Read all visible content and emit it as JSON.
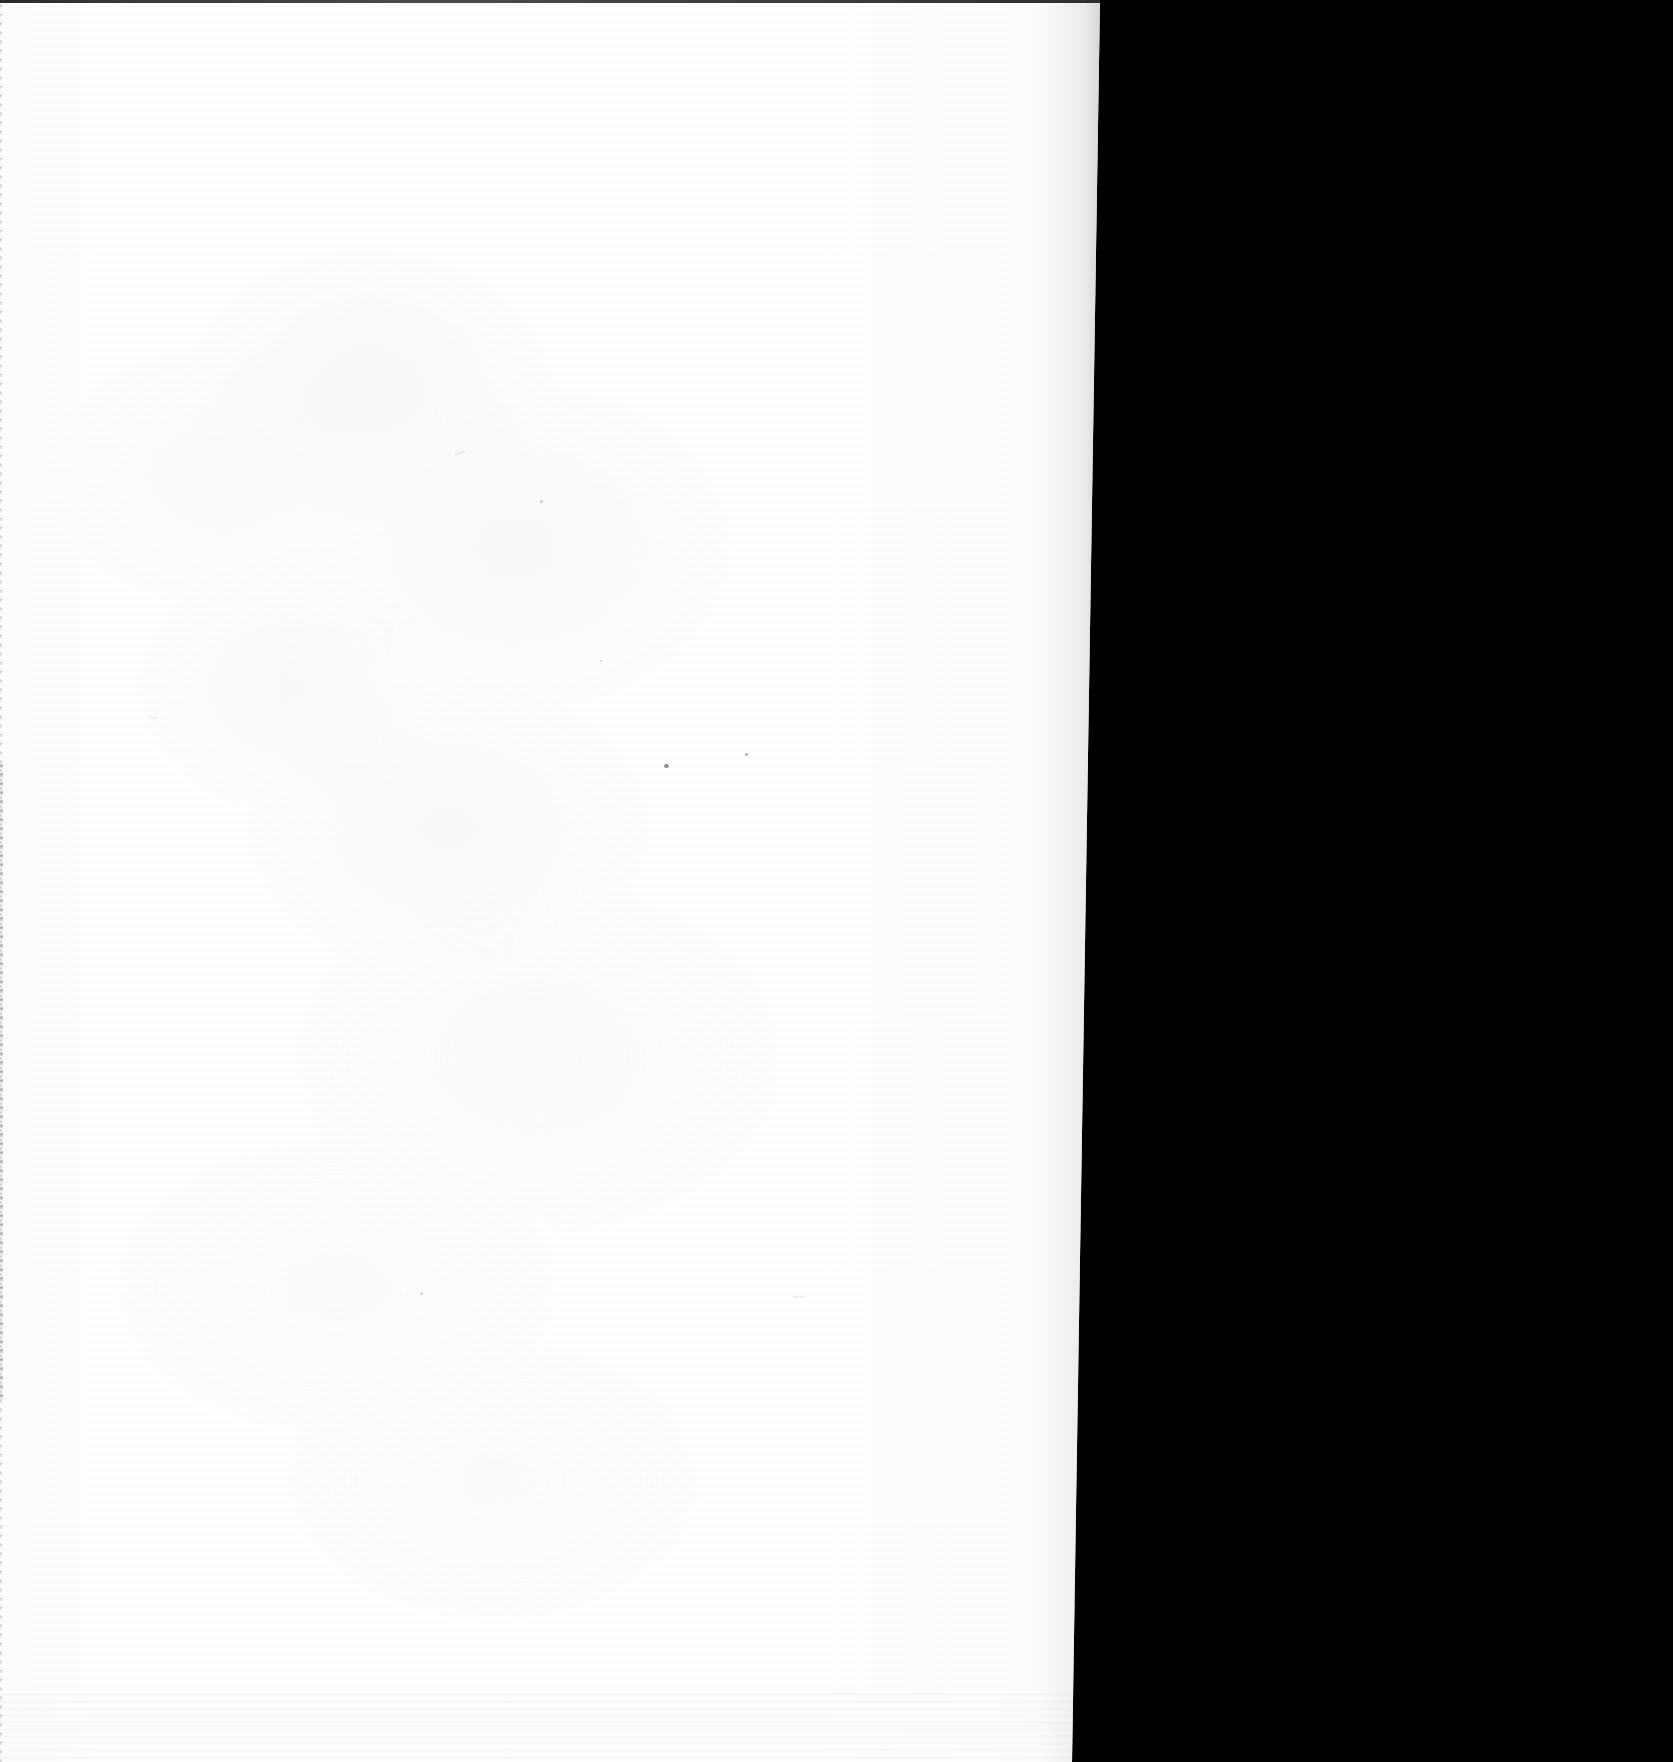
{
  "document": {
    "page_kind": "blank-scanned-leaf",
    "visible_text": "",
    "text_blocks": [],
    "figures": [],
    "captions": [],
    "page_number": "",
    "header": "",
    "footer": "",
    "marginalia": ""
  },
  "scan": {
    "canvas_width": 1673,
    "canvas_height": 1762,
    "paper_region": {
      "label": "paper-sheet",
      "left": 0,
      "top": 0,
      "edge_x_top": 1100,
      "edge_x_middle": 1085,
      "edge_x_bottom": 1072,
      "skewed": true
    },
    "void_region": {
      "label": "scanner-void",
      "side": "right",
      "description": "black area beyond the page edge"
    }
  },
  "colors": {
    "paper": "#fdfdfd",
    "paper_shade": "#f4f4f6",
    "void": "#000000",
    "top_edge_line": "#3a3a3a",
    "gutter_line": "#96969c",
    "dust_speck": "#8d8d90"
  },
  "artifacts": {
    "top_edge_line": "thin dark rule spanning the top of the frame",
    "left_gutter_line": "faint speckled grey line along the left edge, strongest mid-page",
    "paper_grain": "low-contrast mottling across the sheet",
    "scan_streaks": "faint horizontal scanner streaking, heavier near the bottom",
    "dust_specks": [
      {
        "name": "dust-speck-primary",
        "x": 664,
        "y": 764,
        "size": 5
      },
      {
        "name": "dust-speck-secondary",
        "x": 745,
        "y": 753,
        "size": 3
      },
      {
        "name": "dust-speck-upper",
        "x": 540,
        "y": 500,
        "size": 3
      },
      {
        "name": "dust-speck-lower",
        "x": 420,
        "y": 1292,
        "size": 3
      },
      {
        "name": "dust-speck-mid",
        "x": 600,
        "y": 660,
        "size": 2
      }
    ]
  }
}
